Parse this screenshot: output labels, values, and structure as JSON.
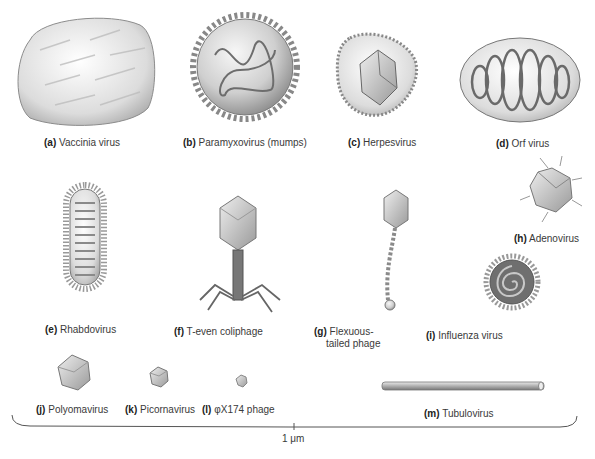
{
  "figure": {
    "panels": [
      {
        "id": "a",
        "letter": "(a)",
        "name": "Vaccinia virus",
        "shape": "rounded-brick"
      },
      {
        "id": "b",
        "letter": "(b)",
        "name": "Paramyxovirus (mumps)",
        "shape": "spiked-sphere-with-helical-nucleocapsid"
      },
      {
        "id": "c",
        "letter": "(c)",
        "name": "Herpesvirus",
        "shape": "enveloped-icosahedron"
      },
      {
        "id": "d",
        "letter": "(d)",
        "name": "Orf virus",
        "shape": "ovoid-with-spiral"
      },
      {
        "id": "e",
        "letter": "(e)",
        "name": "Rhabdovirus",
        "shape": "bullet-shaped"
      },
      {
        "id": "f",
        "letter": "(f)",
        "name": "T-even coliphage",
        "shape": "head-tail-with-legs"
      },
      {
        "id": "g",
        "letter": "(g)",
        "name": "Flexuous-",
        "name2": "tailed phage",
        "shape": "head-with-flexible-tail"
      },
      {
        "id": "h",
        "letter": "(h)",
        "name": "Adenovirus",
        "shape": "icosahedron-with-fibers"
      },
      {
        "id": "i",
        "letter": "(i)",
        "name": "Influenza virus",
        "shape": "spiked-sphere-with-spiral"
      },
      {
        "id": "j",
        "letter": "(j)",
        "name": "Polyomavirus",
        "shape": "icosahedron"
      },
      {
        "id": "k",
        "letter": "(k)",
        "name": "Picornavirus",
        "shape": "small-icosahedron"
      },
      {
        "id": "l",
        "letter": "(l)",
        "name": "φX174 phage",
        "shape": "tiny-icosahedron"
      },
      {
        "id": "m",
        "letter": "(m)",
        "name": "Tubulovirus",
        "shape": "rod"
      }
    ],
    "scale_bar": {
      "label": "1 μm"
    }
  },
  "colors": {
    "background": "#ffffff",
    "virus_light": "#e6e6e6",
    "virus_mid": "#b9b9b9",
    "virus_dark": "#7a7a7a",
    "label_text": "#3a3a3a",
    "bracket": "#555555"
  }
}
